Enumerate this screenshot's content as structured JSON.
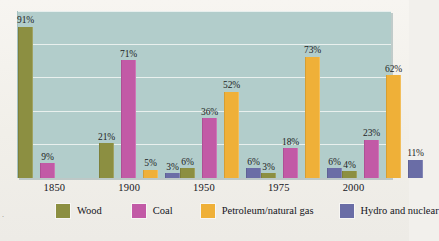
{
  "chart_data": {
    "type": "bar",
    "title": "",
    "subtitle": "",
    "xlabel": "",
    "ylabel": "",
    "ylim": [
      0,
      100
    ],
    "grid": true,
    "grid_interval": 20,
    "legend_position": "bottom",
    "categories": [
      "1850",
      "1900",
      "1950",
      "1975",
      "2000"
    ],
    "value_suffix": "%",
    "series": [
      {
        "name": "Wood",
        "color": "#8c8f41",
        "values": [
          91,
          21,
          6,
          3,
          4
        ],
        "labels": [
          "91%",
          "21%",
          "6%",
          "3%",
          "4%"
        ]
      },
      {
        "name": "Coal",
        "color": "#c25aa6",
        "values": [
          9,
          71,
          36,
          18,
          23
        ],
        "labels": [
          "9%",
          "71%",
          "36%",
          "18%",
          "23%"
        ]
      },
      {
        "name": "Petroleum/natural gas",
        "color": "#efb038",
        "values": [
          null,
          5,
          52,
          73,
          62
        ],
        "labels": [
          "",
          "5%",
          "52%",
          "73%",
          "62%"
        ]
      },
      {
        "name": "Hydro and nuclear",
        "color": "#6a6da6",
        "values": [
          null,
          3,
          6,
          6,
          11
        ],
        "labels": [
          "",
          "3%",
          "6%",
          "6%",
          "11%"
        ]
      }
    ]
  },
  "plot": {
    "background_color": "#b2cdcb",
    "gridline_color": "#eef4f2"
  },
  "legend": {
    "items": [
      {
        "label": "Wood",
        "color": "#8c8f41"
      },
      {
        "label": "Coal",
        "color": "#c25aa6"
      },
      {
        "label": "Petroleum/natural gas",
        "color": "#efb038"
      },
      {
        "label": "Hydro and nuclear",
        "color": "#6a6da6"
      }
    ]
  },
  "page": {
    "corner_mark": "."
  }
}
